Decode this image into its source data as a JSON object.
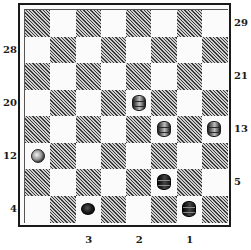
{
  "board": {
    "rows": 8,
    "cols": 8,
    "dark_square_color": "#4a4a4a",
    "light_square_color": "#fbfbfb",
    "pieces": [
      {
        "row": 3,
        "col": 4,
        "color": "light",
        "king": true
      },
      {
        "row": 4,
        "col": 5,
        "color": "light",
        "king": true
      },
      {
        "row": 4,
        "col": 7,
        "color": "light",
        "king": true
      },
      {
        "row": 5,
        "col": 0,
        "color": "light",
        "king": false
      },
      {
        "row": 6,
        "col": 5,
        "color": "dark",
        "king": true
      },
      {
        "row": 7,
        "col": 2,
        "color": "dark",
        "king": false
      },
      {
        "row": 7,
        "col": 6,
        "color": "dark",
        "king": true
      }
    ]
  },
  "labels": {
    "right": [
      {
        "text": "29",
        "row": 0
      },
      {
        "text": "21",
        "row": 2
      },
      {
        "text": "13",
        "row": 4
      },
      {
        "text": "5",
        "row": 6
      }
    ],
    "left": [
      {
        "text": "28",
        "row": 1
      },
      {
        "text": "20",
        "row": 3
      },
      {
        "text": "12",
        "row": 5
      },
      {
        "text": "4",
        "row": 7
      }
    ],
    "bottom": [
      {
        "text": "3",
        "col": 2
      },
      {
        "text": "2",
        "col": 4
      },
      {
        "text": "1",
        "col": 6
      }
    ]
  }
}
